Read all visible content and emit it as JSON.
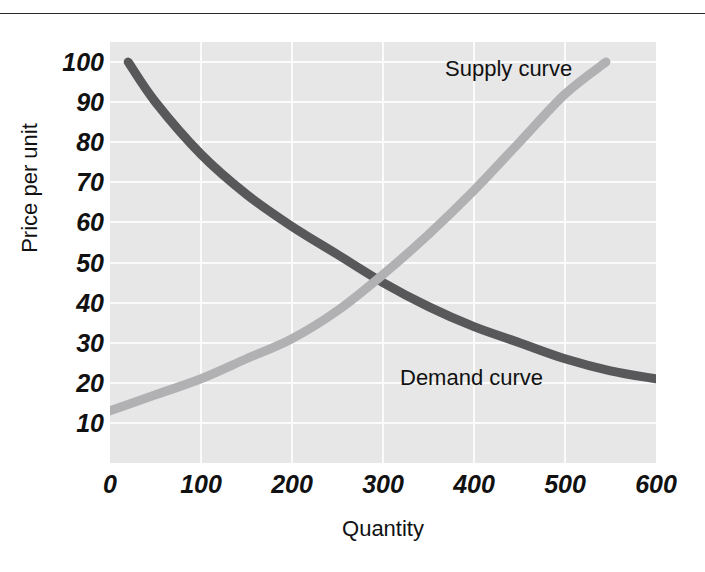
{
  "chart_data": {
    "type": "line",
    "title": "",
    "subtitle": "",
    "xlabel": "Quantity",
    "ylabel": "Price per unit",
    "xlim": [
      0,
      600
    ],
    "ylim": [
      0,
      105
    ],
    "grid": true,
    "legend_position": "inline-annotation",
    "xticks": [
      "0",
      "100",
      "200",
      "300",
      "400",
      "500",
      "600"
    ],
    "xtick_values": [
      0,
      100,
      200,
      300,
      400,
      500,
      600
    ],
    "yticks": [
      "100",
      "90",
      "80",
      "70",
      "60",
      "50",
      "40",
      "30",
      "20",
      "10"
    ],
    "ytick_values": [
      100,
      90,
      80,
      70,
      60,
      50,
      40,
      30,
      20,
      10
    ],
    "series": [
      {
        "name": "Demand curve",
        "color": "#58585a",
        "x": [
          20,
          50,
          100,
          150,
          200,
          250,
          300,
          350,
          400,
          450,
          500,
          550,
          600
        ],
        "values": [
          100,
          90,
          77,
          67,
          59,
          52,
          45,
          39,
          34,
          30,
          26,
          23,
          21
        ]
      },
      {
        "name": "Supply curve",
        "color": "#b1b1b3",
        "x": [
          0,
          50,
          100,
          150,
          200,
          250,
          300,
          350,
          400,
          450,
          500,
          545
        ],
        "values": [
          13,
          17,
          21,
          26,
          31,
          38,
          47,
          57,
          68,
          80,
          92,
          100
        ]
      }
    ],
    "annotations": [
      {
        "text": "Supply curve",
        "x": 360,
        "y": 95
      },
      {
        "text": "Demand curve",
        "x": 325,
        "y": 24
      }
    ],
    "equilibrium": {
      "quantity": 290,
      "price": 46
    }
  },
  "colors": {
    "demand_curve": "#58585a",
    "supply_curve": "#b1b1b3",
    "plot_background": "#e7e7e7",
    "gridline": "#fbfbfb",
    "text": "#111111",
    "rule": "#2b2b2b"
  }
}
